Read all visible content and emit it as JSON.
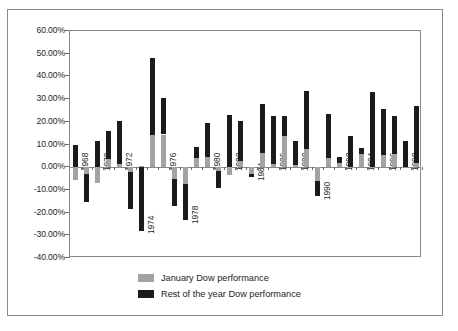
{
  "chart_data": {
    "type": "bar",
    "stacked": true,
    "title": "",
    "subtitle": "",
    "xlabel": "",
    "ylabel": "",
    "ylim": [
      -40,
      60
    ],
    "ytick_step": 10,
    "grid": false,
    "legend_position": "bottom",
    "ytick_labels": [
      "60.00%",
      "50.00%",
      "40.00%",
      "30.00%",
      "20.00%",
      "10.00%",
      "0.00%",
      "-10.00%",
      "-20.00%",
      "-30.00%",
      "-40.00%"
    ],
    "ytick_values": [
      60,
      50,
      40,
      30,
      20,
      10,
      0,
      -10,
      -20,
      -30,
      -40
    ],
    "categories": [
      1968,
      1969,
      1970,
      1971,
      1972,
      1973,
      1974,
      1975,
      1976,
      1977,
      1978,
      1979,
      1980,
      1981,
      1982,
      1983,
      1984,
      1985,
      1986,
      1987,
      1988,
      1989,
      1990,
      1991,
      1992,
      1993,
      1994,
      1995,
      1996,
      1997,
      1998,
      1999
    ],
    "xtick_labels": [
      "1968",
      "1970",
      "1972",
      "1974",
      "1976",
      "1978",
      "1980",
      "1982",
      "1984",
      "1986",
      "1988",
      "1990",
      "1992",
      "1994",
      "1996",
      "1998"
    ],
    "series": [
      {
        "name": "January Dow performance",
        "color": "#a3a3a3",
        "values": [
          -5.5,
          -2.9,
          -7.0,
          3.5,
          1.3,
          -2.1,
          0.6,
          14.2,
          14.4,
          -5.0,
          -7.3,
          4.2,
          4.4,
          -1.7,
          -3.3,
          2.8,
          -3.0,
          6.2,
          1.6,
          13.8,
          1.0,
          8.0,
          -5.9,
          3.9,
          1.7,
          0.3,
          6.0,
          0.2,
          5.4,
          5.7,
          0.0,
          1.9
        ]
      },
      {
        "name": "Rest of the year Dow performance",
        "color": "#1b1b1b",
        "values": [
          9.8,
          -12.5,
          11.5,
          12.5,
          18.9,
          -16.5,
          -28.2,
          33.8,
          15.9,
          -12.3,
          -16.1,
          4.5,
          15.1,
          -7.6,
          22.9,
          17.6,
          -1.2,
          21.5,
          20.9,
          8.8,
          10.4,
          25.7,
          -6.9,
          19.6,
          2.6,
          13.5,
          2.5,
          33.1,
          20.4,
          16.9,
          11.5,
          25.2
        ]
      }
    ],
    "bar_totals": [
      4.3,
      -15.4,
      3.9,
      16.0,
      20.2,
      -18.6,
      -27.6,
      48.0,
      30.3,
      -17.3,
      -23.4,
      8.7,
      19.5,
      -9.3,
      19.6,
      20.4,
      -4.2,
      27.7,
      22.5,
      22.6,
      11.4,
      33.7,
      -12.8,
      23.5,
      4.3,
      13.8,
      8.5,
      33.3,
      25.8,
      22.6,
      11.5,
      27.1
    ]
  },
  "legend": {
    "items": [
      {
        "label": "January Dow performance",
        "color": "#a3a3a3"
      },
      {
        "label": "Rest of the year Dow performance",
        "color": "#1b1b1b"
      }
    ]
  }
}
